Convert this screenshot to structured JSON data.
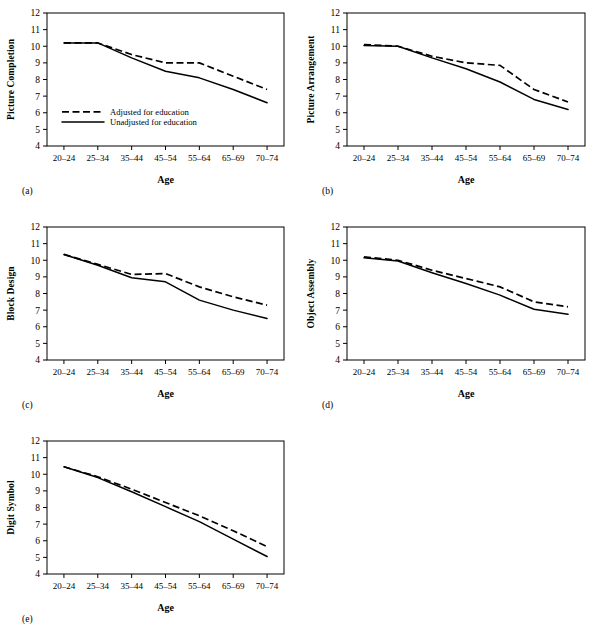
{
  "figure": {
    "background": "#ffffff",
    "series_colors": {
      "adjusted": "#000000",
      "unadjusted": "#000000"
    },
    "legend": {
      "adjusted_label": "Adjusted for education",
      "unadjusted_label": "Unadjusted for education"
    },
    "shared": {
      "xlabel": "Age",
      "categories": [
        "20–24",
        "25–34",
        "35–44",
        "45–54",
        "55–64",
        "65–69",
        "70–74"
      ],
      "yticks": [
        "4",
        "5",
        "6",
        "7",
        "8",
        "9",
        "10",
        "11",
        "12"
      ],
      "ylim": [
        4,
        12
      ]
    }
  },
  "chart_data": [
    {
      "type": "line",
      "panel": "a",
      "panel_letter": "(a)",
      "title": "",
      "ylabel": "Picture Completion",
      "xlabel": "Age",
      "categories": [
        "20–24",
        "25–34",
        "35–44",
        "45–54",
        "55–64",
        "65–69",
        "70–74"
      ],
      "ylim": [
        4,
        12
      ],
      "yticks": [
        4,
        5,
        6,
        7,
        8,
        9,
        10,
        11,
        12
      ],
      "grid": false,
      "legend_position": "inside-lower-left",
      "series": [
        {
          "name": "Adjusted for education",
          "style": "dashed",
          "values": [
            10.2,
            10.2,
            9.5,
            9.0,
            9.0,
            8.2,
            7.4
          ]
        },
        {
          "name": "Unadjusted for education",
          "style": "solid",
          "values": [
            10.2,
            10.2,
            9.3,
            8.5,
            8.1,
            7.4,
            6.6
          ]
        }
      ]
    },
    {
      "type": "line",
      "panel": "b",
      "panel_letter": "(b)",
      "title": "",
      "ylabel": "Picture Arrangement",
      "xlabel": "Age",
      "categories": [
        "20–24",
        "25–34",
        "35–44",
        "45–54",
        "55–64",
        "65–69",
        "70–74"
      ],
      "ylim": [
        4,
        12
      ],
      "yticks": [
        4,
        5,
        6,
        7,
        8,
        9,
        10,
        11,
        12
      ],
      "grid": false,
      "legend_position": "none",
      "series": [
        {
          "name": "Adjusted for education",
          "style": "dashed",
          "values": [
            10.1,
            10.0,
            9.4,
            9.0,
            8.85,
            7.4,
            6.65
          ]
        },
        {
          "name": "Unadjusted for education",
          "style": "solid",
          "values": [
            10.05,
            10.0,
            9.3,
            8.65,
            7.85,
            6.8,
            6.2
          ]
        }
      ]
    },
    {
      "type": "line",
      "panel": "c",
      "panel_letter": "(c)",
      "title": "",
      "ylabel": "Block Design",
      "xlabel": "Age",
      "categories": [
        "20–24",
        "25–34",
        "35–44",
        "45–54",
        "55–64",
        "65–69",
        "70–74"
      ],
      "ylim": [
        4,
        12
      ],
      "yticks": [
        4,
        5,
        6,
        7,
        8,
        9,
        10,
        11,
        12
      ],
      "grid": false,
      "legend_position": "none",
      "series": [
        {
          "name": "Adjusted for education",
          "style": "dashed",
          "values": [
            10.35,
            9.75,
            9.15,
            9.2,
            8.4,
            7.8,
            7.3
          ]
        },
        {
          "name": "Unadjusted for education",
          "style": "solid",
          "values": [
            10.35,
            9.7,
            8.95,
            8.7,
            7.6,
            7.0,
            6.5
          ]
        }
      ]
    },
    {
      "type": "line",
      "panel": "d",
      "panel_letter": "(d)",
      "title": "",
      "ylabel": "Object Assembly",
      "xlabel": "Age",
      "categories": [
        "20–24",
        "25–34",
        "35–44",
        "45–54",
        "55–64",
        "65–69",
        "70–74"
      ],
      "ylim": [
        4,
        12
      ],
      "yticks": [
        4,
        5,
        6,
        7,
        8,
        9,
        10,
        11,
        12
      ],
      "grid": false,
      "legend_position": "none",
      "series": [
        {
          "name": "Adjusted for education",
          "style": "dashed",
          "values": [
            10.2,
            10.0,
            9.4,
            8.9,
            8.4,
            7.5,
            7.2
          ]
        },
        {
          "name": "Unadjusted for education",
          "style": "solid",
          "values": [
            10.15,
            9.95,
            9.25,
            8.6,
            7.9,
            7.05,
            6.75
          ]
        }
      ]
    },
    {
      "type": "line",
      "panel": "e",
      "panel_letter": "(e)",
      "title": "",
      "ylabel": "Digit Symbol",
      "xlabel": "Age",
      "categories": [
        "20–24",
        "25–34",
        "35–44",
        "45–54",
        "55–64",
        "65–69",
        "70–74"
      ],
      "ylim": [
        4,
        12
      ],
      "yticks": [
        4,
        5,
        6,
        7,
        8,
        9,
        10,
        11,
        12
      ],
      "grid": false,
      "legend_position": "none",
      "series": [
        {
          "name": "Adjusted for education",
          "style": "dashed",
          "values": [
            10.45,
            9.85,
            9.1,
            8.3,
            7.5,
            6.6,
            5.65
          ]
        },
        {
          "name": "Unadjusted for education",
          "style": "solid",
          "values": [
            10.45,
            9.8,
            8.95,
            8.05,
            7.15,
            6.1,
            5.05
          ]
        }
      ]
    }
  ]
}
